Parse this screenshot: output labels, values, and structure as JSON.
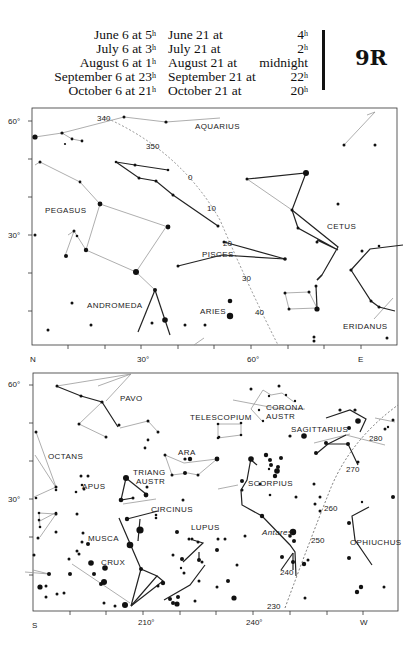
{
  "header": {
    "times_left": [
      {
        "date": "June 6 at",
        "time": "5",
        "unit": "h"
      },
      {
        "date": "July 6 at",
        "time": "3",
        "unit": "h"
      },
      {
        "date": "August 6 at",
        "time": "1",
        "unit": "h"
      },
      {
        "date": "September 6 at",
        "time": "23",
        "unit": "h"
      },
      {
        "date": "October 6 at",
        "time": "21",
        "unit": "h"
      }
    ],
    "times_right": [
      {
        "date": "June 21 at",
        "time": "4",
        "unit": "h"
      },
      {
        "date": "July 21 at",
        "time": "2",
        "unit": "h"
      },
      {
        "date": "August 21 at",
        "time": "midnight",
        "unit": ""
      },
      {
        "date": "September 21 at",
        "time": "22",
        "unit": "h"
      },
      {
        "date": "October 21 at",
        "time": "20",
        "unit": "h"
      }
    ],
    "plate_id": "9R"
  },
  "north_map": {
    "y_axis": [
      "60°",
      "30°"
    ],
    "x_axis": [
      "N",
      "30°",
      "60°",
      "E"
    ],
    "constellations": [
      "AQUARIUS",
      "PEGASUS",
      "PISCES",
      "CETUS",
      "ANDROMEDA",
      "ARIES",
      "ERIDANUS"
    ],
    "ecliptic_marks": [
      "340",
      "350",
      "0",
      "10",
      "20",
      "30",
      "40"
    ]
  },
  "south_map": {
    "y_axis": [
      "60°",
      "30°"
    ],
    "x_axis": [
      "S",
      "210°",
      "240°",
      "W"
    ],
    "constellations": [
      "PAVO",
      "OCTANS",
      "TELESCOPIUM",
      "CORONA",
      "AUSTR",
      "SAGITTARIUS",
      "ARA",
      "APUS",
      "TRIANG",
      "AUSTR",
      "SCORPIUS",
      "CIRCINUS",
      "MUSCA",
      "LUPUS",
      "CRUX",
      "OPHIUCHUS"
    ],
    "star_labels": [
      "Antares"
    ],
    "ecliptic_marks": [
      "280",
      "270",
      "260",
      "250",
      "240",
      "230"
    ]
  },
  "colors": {
    "ink": "#111111",
    "paper": "#ffffff",
    "faint_line": "#888888"
  }
}
